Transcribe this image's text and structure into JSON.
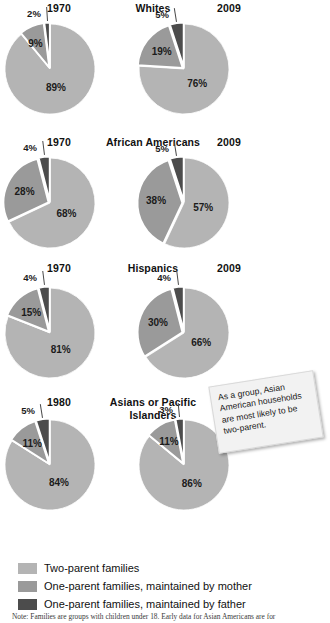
{
  "colors": {
    "two_parent": "#b4b4b4",
    "mother": "#9a9a9a",
    "father": "#4c4c4c",
    "gap": "#ffffff",
    "text": "#1b1b1b",
    "note_bg": "#f2f2f2"
  },
  "legend": {
    "items": [
      {
        "label": "Two-parent families",
        "color_key": "two_parent"
      },
      {
        "label": "One-parent families, maintained by mother",
        "color_key": "mother"
      },
      {
        "label": "One-parent families, maintained by father",
        "color_key": "father"
      }
    ]
  },
  "callout": {
    "text": "As a group, Asian American households are most likely to be two-parent."
  },
  "footnote": {
    "text": "Note: Families are groups with children under 18. Early data for Asian Americans are for"
  },
  "chart_data": {
    "type": "pie",
    "legend_position": "bottom",
    "series_names": [
      "Two-parent families",
      "One-parent families, maintained by mother",
      "One-parent families, maintained by father"
    ],
    "groups": [
      {
        "category": "Whites",
        "charts": [
          {
            "year": "1970",
            "slices": [
              {
                "label": "89%",
                "value": 89,
                "series": "Two-parent families"
              },
              {
                "label": "9%",
                "value": 9,
                "series": "One-parent families, maintained by mother"
              },
              {
                "label": "2%",
                "value": 2,
                "series": "One-parent families, maintained by father"
              }
            ]
          },
          {
            "year": "2009",
            "slices": [
              {
                "label": "76%",
                "value": 76,
                "series": "Two-parent families"
              },
              {
                "label": "19%",
                "value": 19,
                "series": "One-parent families, maintained by mother"
              },
              {
                "label": "5%",
                "value": 5,
                "series": "One-parent families, maintained by father"
              }
            ]
          }
        ]
      },
      {
        "category": "African Americans",
        "charts": [
          {
            "year": "1970",
            "slices": [
              {
                "label": "68%",
                "value": 68,
                "series": "Two-parent families"
              },
              {
                "label": "28%",
                "value": 28,
                "series": "One-parent families, maintained by mother"
              },
              {
                "label": "4%",
                "value": 4,
                "series": "One-parent families, maintained by father"
              }
            ]
          },
          {
            "year": "2009",
            "slices": [
              {
                "label": "57%",
                "value": 57,
                "series": "Two-parent families"
              },
              {
                "label": "38%",
                "value": 38,
                "series": "One-parent families, maintained by mother"
              },
              {
                "label": "5%",
                "value": 5,
                "series": "One-parent families, maintained by father"
              }
            ]
          }
        ]
      },
      {
        "category": "Hispanics",
        "charts": [
          {
            "year": "1970",
            "slices": [
              {
                "label": "81%",
                "value": 81,
                "series": "Two-parent families"
              },
              {
                "label": "15%",
                "value": 15,
                "series": "One-parent families, maintained by mother"
              },
              {
                "label": "4%",
                "value": 4,
                "series": "One-parent families, maintained by father"
              }
            ]
          },
          {
            "year": "2009",
            "slices": [
              {
                "label": "66%",
                "value": 66,
                "series": "Two-parent families"
              },
              {
                "label": "30%",
                "value": 30,
                "series": "One-parent families, maintained by mother"
              },
              {
                "label": "4%",
                "value": 4,
                "series": "One-parent families, maintained by father"
              }
            ]
          }
        ]
      },
      {
        "category": "Asians or Pacific Islanders",
        "charts": [
          {
            "year": "1980",
            "slices": [
              {
                "label": "84%",
                "value": 84,
                "series": "Two-parent families"
              },
              {
                "label": "11%",
                "value": 11,
                "series": "One-parent families, maintained by mother"
              },
              {
                "label": "5%",
                "value": 5,
                "series": "One-parent families, maintained by father"
              }
            ]
          },
          {
            "year": "2009",
            "slices": [
              {
                "label": "86%",
                "value": 86,
                "series": "Two-parent families"
              },
              {
                "label": "11%",
                "value": 11,
                "series": "One-parent families, maintained by mother"
              },
              {
                "label": "3%",
                "value": 3,
                "series": "One-parent families, maintained by father"
              }
            ]
          }
        ]
      }
    ]
  }
}
